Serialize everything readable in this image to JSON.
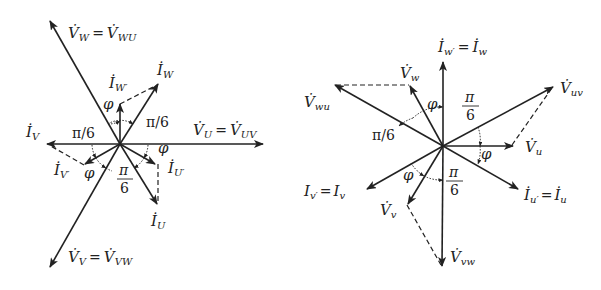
{
  "figure": {
    "left_diagram": {
      "name": "Y-connection phasor diagram (uppercase)",
      "labels": {
        "vw": "V̇W = V̇WU",
        "vw_main": "V̇",
        "vw_sub": "W",
        "vw_eq": "=",
        "vw_rhs_main": "V̇",
        "vw_rhs_sub": "WU",
        "iw": "İ",
        "iw_sub": "W",
        "iwp": "İ",
        "iwp_sub": "W′",
        "vu_main": "V̇",
        "vu_sub": "U",
        "vu_eq": "=",
        "vu_rhs_main": "V̇",
        "vu_rhs_sub": "UV",
        "iv": "İ",
        "iv_sub": "V",
        "ivp": "İ",
        "ivp_sub": "V′",
        "iup": "İ",
        "iup_sub": "U′",
        "iu": "İ",
        "iu_sub": "U",
        "vv_main": "V̇",
        "vv_sub": "V",
        "vv_eq": "=",
        "vv_rhs_main": "V̇",
        "vv_rhs_sub": "VW",
        "pi6_upper_right": "π/6",
        "pi6_left": "π/6",
        "pi6_frac_num": "π",
        "pi6_frac_den": "6",
        "phi": "φ"
      }
    },
    "right_diagram": {
      "name": "Delta-connection phasor diagram (lowercase)",
      "labels": {
        "iw_main": "İ",
        "iw_sub": "w′",
        "iw_eq": "=",
        "iw_rhs": "İ",
        "iw_rhs_sub": "w",
        "vw_main": "V̇",
        "vw_sub": "w",
        "vwu_main": "V̇",
        "vwu_sub": "wu",
        "vuv_main": "V̇",
        "vuv_sub": "uv",
        "vu_main": "V̇",
        "vu_sub": "u",
        "iv_main": "I",
        "iv_sub": "v′",
        "iv_eq": "=",
        "iv_rhs": "I",
        "iv_rhs_sub": "v",
        "iu_main": "İ",
        "iu_sub": "u′",
        "iu_eq": "=",
        "iu_rhs": "İ",
        "iu_rhs_sub": "u",
        "vv_main": "V̇",
        "vv_sub": "v",
        "vvw_main": "V̇",
        "vvw_sub": "vw",
        "pi6_left": "π/6",
        "pi6_frac_num": "π",
        "pi6_frac_den": "6",
        "phi": "φ"
      }
    }
  }
}
